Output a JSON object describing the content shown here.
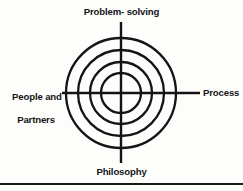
{
  "figure": {
    "type": "concentric-circle-diagram",
    "title_visible": false,
    "background_color": "#fdfdfc",
    "ink_color": "#141414"
  },
  "labels": {
    "top": "Problem- solving",
    "left_line1": "People and",
    "left_line2": "Partners",
    "right": "Process",
    "bottom": "Philosophy"
  },
  "diagram": {
    "center": {
      "x": 121,
      "y": 93
    },
    "rings": [
      {
        "index": 1,
        "radius": 20
      },
      {
        "index": 2,
        "radius": 31
      },
      {
        "index": 3,
        "radius": 43
      },
      {
        "index": 4,
        "radius": 55
      }
    ],
    "ring_count": 4,
    "stroke_width": 2.3,
    "axes": {
      "horizontal": {
        "x1": 62,
        "x2": 200,
        "y": 93
      },
      "vertical": {
        "x": 121,
        "y1": 22,
        "y2": 163
      }
    }
  },
  "footer": {
    "rule_present": true
  }
}
